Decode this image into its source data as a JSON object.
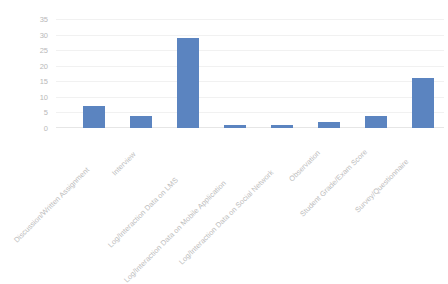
{
  "chart_data": {
    "type": "bar",
    "title": "",
    "subtitle": "",
    "xlabel": "",
    "ylabel": "",
    "ylim": [
      0,
      35
    ],
    "yticks": [
      "0",
      "5",
      "10",
      "15",
      "20",
      "25",
      "30",
      "35"
    ],
    "grid": true,
    "legend": false,
    "legend_position": "none",
    "bar_color": "#5b84c0",
    "categories": [
      "Discussion/Written Assignment",
      "Interview",
      "Log/Interaction Data on LMS",
      "Log/Interaction Data on Mobile Application",
      "Log/Interaction Data on Social Network",
      "Observation",
      "Student Grade/Exam Score",
      "Survey/Questionnaire"
    ],
    "values": [
      7,
      4,
      29,
      1,
      1,
      2,
      4,
      16
    ]
  }
}
